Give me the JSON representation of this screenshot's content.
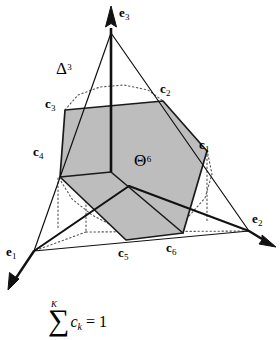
{
  "figure": {
    "title_symbols": {
      "simplex_label": "Δ",
      "simplex_exponent": "3",
      "polytope_label": "Θ",
      "polytope_exponent": "6"
    },
    "basis_vertices": [
      {
        "id": "e1",
        "base": "e",
        "sub": "1"
      },
      {
        "id": "e2",
        "base": "e",
        "sub": "2"
      },
      {
        "id": "e3",
        "base": "e",
        "sub": "3"
      }
    ],
    "hexagon_vertices": [
      {
        "id": "c1",
        "base": "c",
        "sub": "1"
      },
      {
        "id": "c2",
        "base": "c",
        "sub": "2"
      },
      {
        "id": "c3",
        "base": "c",
        "sub": "3"
      },
      {
        "id": "c4",
        "base": "c",
        "sub": "4"
      },
      {
        "id": "c5",
        "base": "c",
        "sub": "5"
      },
      {
        "id": "c6",
        "base": "c",
        "sub": "6"
      }
    ],
    "colors": {
      "fill": "#bdbdbd",
      "stroke": "#1a1a1a",
      "background": "#ffffff"
    }
  },
  "caption": {
    "sum_limit_top": "K",
    "sum_sign": "∑",
    "summand_base": "c",
    "summand_sub": "k",
    "equals": " = 1"
  }
}
